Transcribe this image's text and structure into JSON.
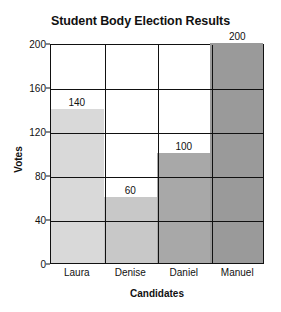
{
  "chart_data": {
    "type": "bar",
    "title": "Student Body Election Results",
    "xlabel": "Candidates",
    "ylabel": "Votes",
    "categories": [
      "Laura",
      "Denise",
      "Daniel",
      "Manuel"
    ],
    "values": [
      140,
      60,
      100,
      200
    ],
    "value_labels": [
      "140",
      "60",
      "100",
      "200"
    ],
    "bar_colors": [
      "#d9d9d9",
      "#c8c8c8",
      "#a8a8a8",
      "#9a9a9a"
    ],
    "ylim": [
      0,
      200
    ],
    "yticks": [
      0,
      40,
      80,
      120,
      160,
      200
    ],
    "ytick_labels": [
      "0",
      "40",
      "80",
      "120",
      "160",
      "200"
    ],
    "grid": true,
    "grid_color": "#111111",
    "legend": false
  }
}
